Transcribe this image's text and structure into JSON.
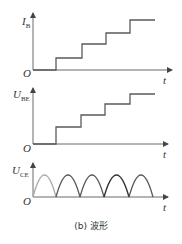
{
  "figure": {
    "caption": "(b) 波形",
    "plots": [
      {
        "id": "ib",
        "y_label_main": "I",
        "y_label_sub": "B",
        "origin_label": "O",
        "x_label": "t",
        "type": "staircase",
        "steps": 4
      },
      {
        "id": "ube",
        "y_label_main": "U",
        "y_label_sub": "BE",
        "origin_label": "O",
        "x_label": "t",
        "type": "staircase",
        "steps": 4
      },
      {
        "id": "uce",
        "y_label_main": "U",
        "y_label_sub": "CE",
        "origin_label": "O",
        "x_label": "t",
        "type": "rectified-sine",
        "humps": 5
      }
    ]
  }
}
